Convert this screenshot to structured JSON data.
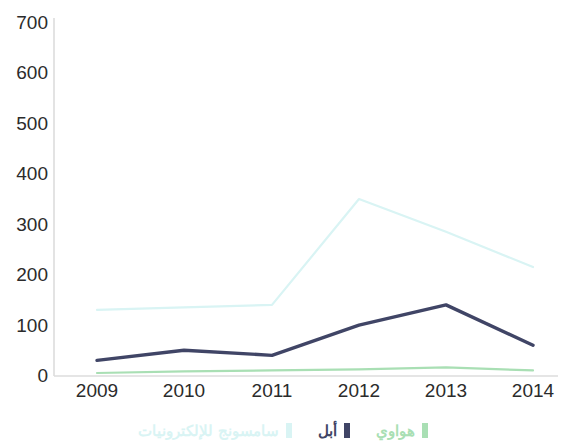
{
  "chart_data": {
    "type": "line",
    "title": "",
    "xlabel": "",
    "ylabel": "",
    "categories": [
      "2009",
      "2010",
      "2011",
      "2012",
      "2013",
      "2014"
    ],
    "ylim": [
      0,
      700
    ],
    "yticks": [
      0,
      100,
      200,
      300,
      400,
      500,
      600,
      700
    ],
    "grid": false,
    "legend_position": "bottom",
    "series": [
      {
        "name": "سامسونج للإلكترونيات",
        "color": "#d9f4f4",
        "values": [
          130,
          135,
          140,
          350,
          285,
          215
        ]
      },
      {
        "name": "أبل",
        "color": "#404566",
        "values": [
          30,
          50,
          40,
          100,
          140,
          60
        ]
      },
      {
        "name": "هواوي",
        "color": "#a9dfb4",
        "values": [
          5,
          8,
          10,
          12,
          16,
          10
        ]
      }
    ]
  },
  "axis": {
    "y_tick_labels": [
      "700",
      "600",
      "500",
      "400",
      "300",
      "200",
      "100",
      "0"
    ],
    "x_tick_labels": [
      "2009",
      "2010",
      "2011",
      "2012",
      "2013",
      "2014"
    ]
  },
  "legend": {
    "items": [
      {
        "label": "سامسونج للإلكترونيات",
        "color": "#d9f4f4"
      },
      {
        "label": "أبل",
        "color": "#404566"
      },
      {
        "label": "هواوي",
        "color": "#a9dfb4"
      }
    ]
  },
  "colors": {
    "axis_line": "#d5d5d5",
    "tick_text": "#2b2b2b",
    "background": "#ffffff"
  }
}
